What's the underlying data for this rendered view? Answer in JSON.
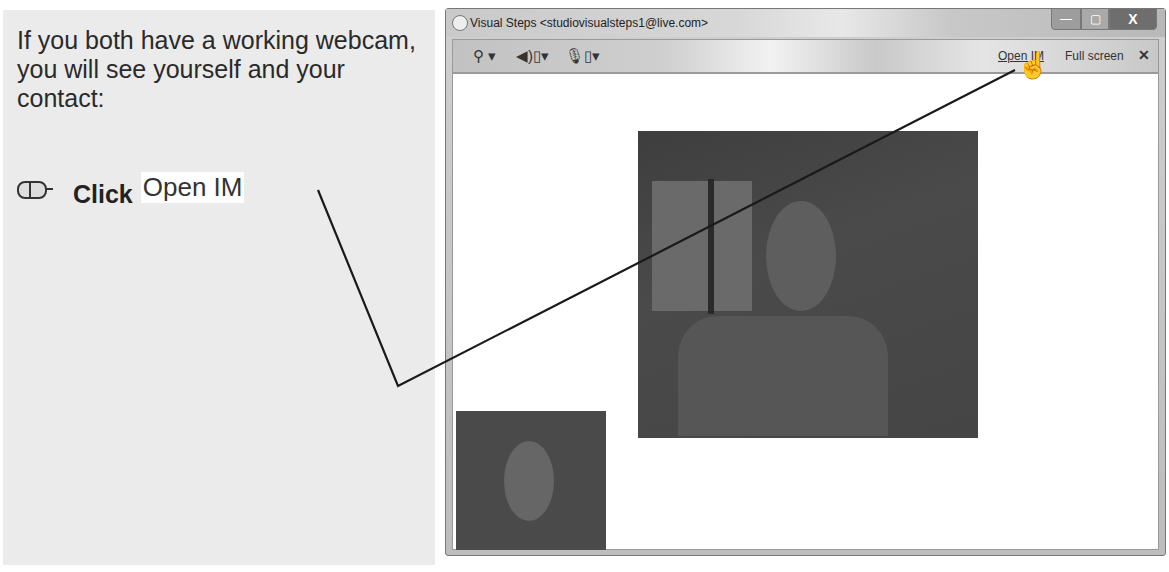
{
  "instruction": {
    "text": "If you both have a working webcam, you will see yourself and your contact:",
    "step_verb": "Click",
    "step_target": "Open IM",
    "step_icon": "mouse-icon"
  },
  "window": {
    "title": "Visual Steps <studiovisualsteps1@live.com>",
    "controls": {
      "minimize": "—",
      "maximize": "▢",
      "close": "X"
    },
    "toolbar": {
      "webcam_icon": "webcam-icon",
      "speaker_icon": "speaker-icon",
      "mic_icon": "microphone-icon",
      "open_im": "Open IM",
      "full_screen": "Full screen",
      "close": "✕"
    },
    "videos": {
      "remote": "contact-video",
      "self": "self-video"
    }
  },
  "cursor": "hand-pointer"
}
